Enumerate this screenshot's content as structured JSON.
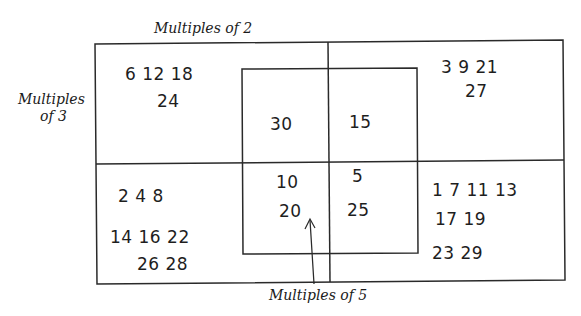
{
  "diagram": {
    "type": "venn-diagram",
    "labels": {
      "multiples_of_2": "Multiples of 2",
      "multiples_of_3_line1": "Multiples",
      "multiples_of_3_line2": "of 3",
      "multiples_of_5": "Multiples of 5"
    },
    "regions": {
      "only_2_and_3": {
        "rows": [
          "6  12  18",
          "24"
        ]
      },
      "only_3": {
        "rows": [
          "3  9  21",
          "27"
        ]
      },
      "2_3_5": {
        "rows": [
          "30"
        ]
      },
      "3_5": {
        "rows": [
          "15"
        ]
      },
      "only_2": {
        "rows": [
          "2  4   8",
          "14  16  22",
          "26  28"
        ]
      },
      "2_5": {
        "rows": [
          "10",
          "20"
        ]
      },
      "only_5": {
        "rows": [
          "5",
          "25"
        ]
      },
      "none": {
        "rows": [
          "1  7 11 13",
          "17  19",
          "23  29"
        ]
      }
    },
    "colors": {
      "line": "#2a2a2a",
      "text": "#1e1e1e",
      "background": "#ffffff"
    }
  }
}
